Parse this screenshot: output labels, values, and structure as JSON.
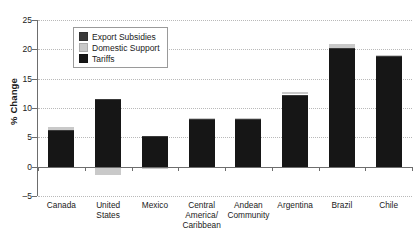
{
  "chart_data": {
    "type": "bar",
    "title": "",
    "xlabel": "",
    "ylabel": "% Change",
    "ylim": [
      -5,
      25
    ],
    "yticks": [
      -5,
      0,
      5,
      10,
      15,
      20,
      25
    ],
    "ytick_labels": [
      "–5",
      "0",
      "5",
      "10",
      "15",
      "20",
      "25"
    ],
    "grid": true,
    "stacked": true,
    "legend_position": "upper-left-inside",
    "categories": [
      "Canada",
      "United States",
      "Mexico",
      "Central America/ Caribbean",
      "Andean Community",
      "Argentina",
      "Brazil",
      "Chile"
    ],
    "category_lines": [
      [
        "Canada"
      ],
      [
        "United",
        "States"
      ],
      [
        "Mexico"
      ],
      [
        "Central",
        "America/",
        "Caribbean"
      ],
      [
        "Andean",
        "Community"
      ],
      [
        "Argentina"
      ],
      [
        "Brazil"
      ],
      [
        "Chile"
      ]
    ],
    "series": [
      {
        "name": "Export Subsidies",
        "color": "#3a3a3a",
        "values": [
          0.3,
          0.3,
          0.2,
          0.2,
          0.2,
          0.3,
          0.3,
          0.3
        ]
      },
      {
        "name": "Domestic Support",
        "color": "#c9c9c9",
        "values": [
          0.5,
          -1.5,
          -0.4,
          0.1,
          0.1,
          0.5,
          0.6,
          0.1
        ]
      },
      {
        "name": "Tariffs",
        "color": "#161616",
        "values": [
          6.0,
          11.3,
          5.1,
          8.0,
          8.0,
          12.0,
          20.0,
          18.7
        ]
      }
    ],
    "totals": [
      6.6,
      11.6,
      5.3,
      8.2,
      8.2,
      12.6,
      20.8,
      19.0
    ],
    "negative_totals": [
      0,
      -1.5,
      -0.4,
      0,
      0,
      0,
      0,
      0
    ]
  },
  "legend": {
    "items": [
      {
        "label": "Export Subsidies",
        "swatch": "export"
      },
      {
        "label": "Domestic Support",
        "swatch": "domestic"
      },
      {
        "label": "Tariffs",
        "swatch": "tariffs"
      }
    ]
  }
}
